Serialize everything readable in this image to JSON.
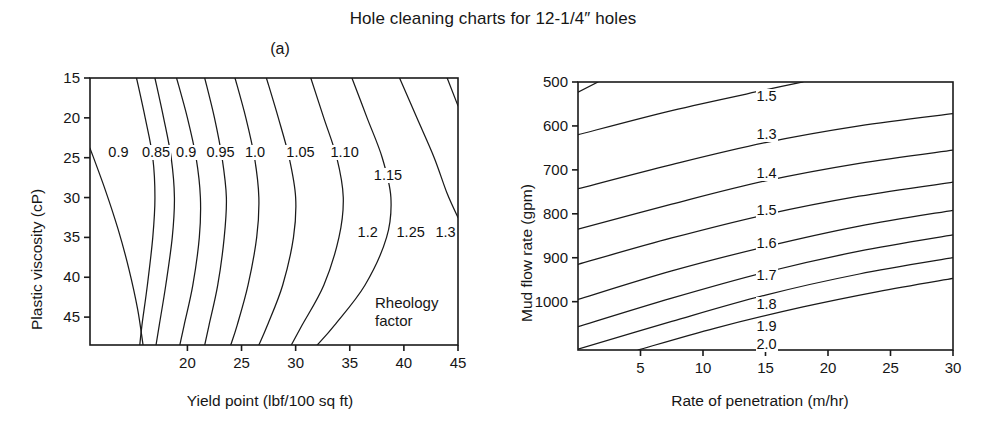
{
  "figure": {
    "title": "Hole cleaning charts for 12-1/4″ holes"
  },
  "panel_a": {
    "caption": "(a)",
    "xlabel": "Yield point (lbf/100 sq ft)",
    "ylabel": "Plastic viscosity (cP)",
    "annotation_line1": "Rheology",
    "annotation_line2": "factor",
    "xticks": [
      "20",
      "25",
      "30",
      "35",
      "40",
      "45"
    ],
    "yticks": [
      "45",
      "40",
      "35",
      "30",
      "25",
      "20",
      "15"
    ],
    "contour_labels": [
      "0.9",
      "0.85",
      "0.9",
      "0.95",
      "1.0",
      "1.05",
      "1.10",
      "1.15",
      "1.2",
      "1.25",
      "1.3"
    ]
  },
  "panel_b": {
    "caption": "(b)",
    "xlabel": "Rate of penetration (m/hr)",
    "ylabel": "Mud flow rate (gpm)",
    "xticks": [
      "5",
      "10",
      "15",
      "20",
      "25",
      "30"
    ],
    "yticks": [
      "1000",
      "900",
      "800",
      "700",
      "600",
      "500"
    ],
    "contour_labels": [
      "1.5",
      "1.3",
      "1.4",
      "1.5",
      "1.6",
      "1.7",
      "1.8",
      "1.9",
      "2.0"
    ]
  },
  "chart_data": [
    {
      "type": "line",
      "subtype": "contour",
      "panel": "(a)",
      "title": "Hole cleaning charts for 12-1/4″ holes",
      "subtitle": "(a)",
      "xlabel": "Yield point (lbf/100 sq ft)",
      "ylabel": "Plastic viscosity (cP)",
      "xlim": [
        11.0,
        45.0
      ],
      "ylim": [
        11.5,
        45.0
      ],
      "xticks": [
        20,
        25,
        30,
        35,
        40,
        45
      ],
      "yticks": [
        15,
        20,
        25,
        30,
        35,
        40,
        45
      ],
      "grid": false,
      "legend": "none",
      "annotations": [
        "Rheology factor"
      ],
      "contour_variable": "Rheology factor",
      "contour_levels": [
        0.9,
        0.85,
        0.9,
        0.95,
        1.0,
        1.05,
        1.1,
        1.15,
        1.2,
        1.25,
        1.3
      ],
      "series": [
        {
          "name": "0.9",
          "comment": "leftmost curve: steeply falling from PV 36 at YP 11 toward YP 16 at low PV",
          "points": [
            [
              11.0,
              36.2
            ],
            [
              12.4,
              31.0
            ],
            [
              13.6,
              26.0
            ],
            [
              14.6,
              21.0
            ],
            [
              15.4,
              16.0
            ],
            [
              15.9,
              11.5
            ]
          ]
        },
        {
          "name": "0.85",
          "comment": "near-vertical, slight left lean at bottom",
          "points": [
            [
              15.3,
              45.0
            ],
            [
              16.1,
              40.0
            ],
            [
              16.8,
              35.0
            ],
            [
              17.0,
              30.0
            ],
            [
              16.8,
              25.0
            ],
            [
              16.3,
              19.0
            ],
            [
              15.8,
              14.0
            ],
            [
              15.6,
              11.5
            ]
          ]
        },
        {
          "name": "0.9",
          "comment": "second 0.9 contour, near vertical",
          "points": [
            [
              17.0,
              45.0
            ],
            [
              17.8,
              40.0
            ],
            [
              18.5,
              35.0
            ],
            [
              18.8,
              30.0
            ],
            [
              18.6,
              25.0
            ],
            [
              18.0,
              19.0
            ],
            [
              17.4,
              14.0
            ],
            [
              17.1,
              11.5
            ]
          ]
        },
        {
          "name": "0.95",
          "points": [
            [
              19.0,
              45.0
            ],
            [
              20.0,
              40.0
            ],
            [
              20.8,
              35.0
            ],
            [
              21.2,
              30.0
            ],
            [
              21.1,
              25.0
            ],
            [
              20.5,
              19.0
            ],
            [
              19.7,
              14.0
            ],
            [
              19.3,
              11.5
            ]
          ]
        },
        {
          "name": "1.0",
          "points": [
            [
              21.6,
              45.0
            ],
            [
              22.5,
              40.0
            ],
            [
              23.2,
              35.0
            ],
            [
              23.6,
              30.0
            ],
            [
              23.4,
              25.0
            ],
            [
              22.8,
              19.0
            ],
            [
              22.0,
              14.0
            ],
            [
              21.6,
              11.5
            ]
          ]
        },
        {
          "name": "1.05",
          "points": [
            [
              24.4,
              45.0
            ],
            [
              25.4,
              40.0
            ],
            [
              26.2,
              35.0
            ],
            [
              26.6,
              30.0
            ],
            [
              26.4,
              25.0
            ],
            [
              25.6,
              19.0
            ],
            [
              24.6,
              14.0
            ],
            [
              24.0,
              11.5
            ]
          ]
        },
        {
          "name": "1.10",
          "points": [
            [
              27.3,
              45.0
            ],
            [
              28.4,
              40.0
            ],
            [
              29.4,
              35.0
            ],
            [
              30.0,
              30.0
            ],
            [
              29.8,
              25.0
            ],
            [
              28.8,
              19.0
            ],
            [
              27.4,
              14.0
            ],
            [
              26.6,
              11.5
            ]
          ]
        },
        {
          "name": "1.15",
          "points": [
            [
              31.4,
              45.0
            ],
            [
              32.6,
              40.0
            ],
            [
              33.8,
              35.0
            ],
            [
              34.4,
              30.0
            ],
            [
              34.0,
              25.0
            ],
            [
              32.6,
              19.0
            ],
            [
              30.6,
              14.0
            ],
            [
              29.6,
              11.5
            ]
          ]
        },
        {
          "name": "1.2",
          "points": [
            [
              35.2,
              45.0
            ],
            [
              36.6,
              40.0
            ],
            [
              38.0,
              35.0
            ],
            [
              38.8,
              30.0
            ],
            [
              38.4,
              25.0
            ],
            [
              36.4,
              19.0
            ],
            [
              33.6,
              14.0
            ],
            [
              32.0,
              11.5
            ]
          ]
        },
        {
          "name": "1.25",
          "points": [
            [
              39.6,
              45.0
            ],
            [
              41.2,
              40.0
            ],
            [
              42.8,
              35.0
            ],
            [
              44.0,
              30.5
            ],
            [
              45.0,
              27.5
            ]
          ]
        },
        {
          "name": "1.3",
          "points": [
            [
              44.0,
              45.0
            ],
            [
              45.0,
              41.5
            ]
          ]
        }
      ]
    },
    {
      "type": "line",
      "subtype": "contour",
      "panel": "(b)",
      "subtitle": "(b)",
      "xlabel": "Rate of penetration (m/hr)",
      "ylabel": "Mud flow rate (gpm)",
      "xlim": [
        0.0,
        30.0
      ],
      "ylim": [
        390.0,
        1000.0
      ],
      "xticks": [
        5,
        10,
        15,
        20,
        25,
        30
      ],
      "yticks": [
        500,
        600,
        700,
        800,
        900,
        1000
      ],
      "grid": false,
      "legend": "none",
      "contour_variable": "Rheology factor",
      "contour_levels": [
        1.5,
        1.3,
        1.4,
        1.5,
        1.6,
        1.7,
        1.8,
        1.9,
        2.0
      ],
      "series": [
        {
          "name": "1.5-top",
          "comment": "tiny wedge in upper-left corner",
          "points": [
            [
              0.0,
              977.0
            ],
            [
              1.6,
              1000.0
            ]
          ]
        },
        {
          "name": "1.3",
          "points": [
            [
              0.0,
              880.0
            ],
            [
              7.5,
              935.0
            ],
            [
              15.0,
              982.0
            ],
            [
              18.0,
              1000.0
            ]
          ]
        },
        {
          "name": "1.4",
          "points": [
            [
              0.0,
              757.0
            ],
            [
              7.5,
              812.0
            ],
            [
              15.0,
              862.0
            ],
            [
              22.5,
              900.0
            ],
            [
              30.0,
              928.0
            ]
          ]
        },
        {
          "name": "1.5",
          "points": [
            [
              0.0,
              665.0
            ],
            [
              7.5,
              722.0
            ],
            [
              15.0,
              775.0
            ],
            [
              22.5,
              815.0
            ],
            [
              30.0,
              845.0
            ]
          ]
        },
        {
          "name": "1.6",
          "points": [
            [
              0.0,
              585.0
            ],
            [
              7.5,
              645.0
            ],
            [
              15.0,
              698.0
            ],
            [
              22.5,
              740.0
            ],
            [
              30.0,
              772.0
            ]
          ]
        },
        {
          "name": "1.7",
          "points": [
            [
              0.0,
              505.0
            ],
            [
              7.5,
              570.0
            ],
            [
              15.0,
              625.0
            ],
            [
              22.5,
              672.0
            ],
            [
              30.0,
              708.0
            ]
          ]
        },
        {
          "name": "1.8",
          "points": [
            [
              0.0,
              443.0
            ],
            [
              7.5,
              508.0
            ],
            [
              15.0,
              567.0
            ],
            [
              22.5,
              615.0
            ],
            [
              30.0,
              652.0
            ]
          ]
        },
        {
          "name": "1.9",
          "points": [
            [
              0.0,
              392.0
            ],
            [
              7.5,
              455.0
            ],
            [
              15.0,
              515.0
            ],
            [
              22.5,
              563.0
            ],
            [
              30.0,
              600.0
            ]
          ]
        },
        {
          "name": "2.0",
          "points": [
            [
              4.8,
              390.0
            ],
            [
              11.0,
              440.0
            ],
            [
              18.0,
              488.0
            ],
            [
              24.0,
              523.0
            ],
            [
              30.0,
              553.0
            ]
          ]
        }
      ]
    }
  ]
}
